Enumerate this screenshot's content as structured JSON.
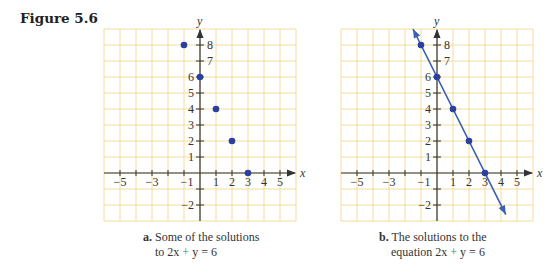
{
  "figure": {
    "label": "Figure 5.6"
  },
  "panels": [
    {
      "id": "a",
      "caption_prefix": "a.",
      "caption_line1": "Some of the solutions",
      "caption_line2_pre": "to 2x",
      "caption_line2_op": "+",
      "caption_line2_post": "y = 6"
    },
    {
      "id": "b",
      "caption_prefix": "b.",
      "caption_line1": "The solutions to the",
      "caption_line2_pre": "equation 2x",
      "caption_line2_op": "+",
      "caption_line2_post": "y = 6"
    }
  ],
  "colors": {
    "grid": "#f3dc9a",
    "axis": "#333333",
    "point": "#2a3f9f",
    "line": "#3a5fb5",
    "plus": "#3a8a6a"
  },
  "chart_data": [
    {
      "type": "scatter",
      "title": "a. Some of the solutions to 2x + y = 6",
      "xlabel": "x",
      "ylabel": "y",
      "xlim": [
        -6,
        6
      ],
      "ylim": [
        -3,
        9
      ],
      "grid": true,
      "x_tick_labels": [
        "-5",
        "-3",
        "-1",
        "1",
        "2",
        "3",
        "4",
        "5"
      ],
      "y_tick_labels": [
        "8",
        "7",
        "6",
        "5",
        "4",
        "3",
        "2",
        "1",
        "-2"
      ],
      "series": [
        {
          "name": "solutions",
          "points": [
            [
              -1,
              8
            ],
            [
              0,
              6
            ],
            [
              1,
              4
            ],
            [
              2,
              2
            ],
            [
              3,
              0
            ]
          ]
        }
      ]
    },
    {
      "type": "line",
      "title": "b. The solutions to the equation 2x + y = 6",
      "xlabel": "x",
      "ylabel": "y",
      "xlim": [
        -6,
        6
      ],
      "ylim": [
        -3,
        9
      ],
      "grid": true,
      "x_tick_labels": [
        "-5",
        "-3",
        "-1",
        "1",
        "2",
        "3",
        "4",
        "5"
      ],
      "y_tick_labels": [
        "8",
        "7",
        "6",
        "5",
        "4",
        "3",
        "2",
        "1",
        "-2"
      ],
      "series": [
        {
          "name": "2x + y = 6",
          "equation": "y = 6 - 2x",
          "line_extent_x": [
            -1.5,
            4.3
          ]
        },
        {
          "name": "solutions",
          "points": [
            [
              -1,
              8
            ],
            [
              0,
              6
            ],
            [
              1,
              4
            ],
            [
              2,
              2
            ],
            [
              3,
              0
            ]
          ]
        }
      ]
    }
  ]
}
